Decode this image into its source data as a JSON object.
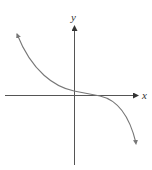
{
  "figure": {
    "type": "function-graph",
    "axes": {
      "x_label": "x",
      "y_label": "y",
      "x_axis_arrow": "right",
      "y_axis_arrow": "up"
    },
    "curve": {
      "shape": "decreasing, concave up on left, flat near x-axis right of origin, concave down on right",
      "left_end": "arrow pointing up-left",
      "right_end": "arrow pointing down-right"
    },
    "colors": {
      "axis": "#555555",
      "curve": "#777777",
      "label": "#333333"
    }
  }
}
